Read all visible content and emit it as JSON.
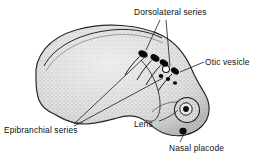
{
  "figure": {
    "background_color": "#ffffff",
    "ink_color": "#101010",
    "body_fill_color": "#d9d9d9",
    "stipple_color": "#8a8a8a",
    "placode_color": "#0a0a0a",
    "otic_vesicle_fill": "#ffffff"
  },
  "labels": {
    "dorsolateral": "Dorsolateral series",
    "otic_vesicle": "Otic vesicle",
    "epibranchial": "Epibranchial series",
    "lens": "Lens",
    "nasal_placode": "Nasal placode"
  },
  "structures": {
    "dorsolateral_placodes_count": 4,
    "epibranchial_placodes_count": 3,
    "otic_vesicle_count": 1,
    "lens_count": 1,
    "nasal_placode_count": 1
  }
}
